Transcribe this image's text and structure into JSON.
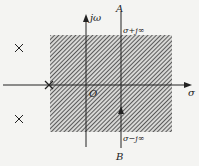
{
  "diagram": {
    "type": "s-plane inverse Laplace integration path",
    "axes": {
      "horizontal_label": "σ",
      "vertical_label": "jω",
      "origin_label": "O"
    },
    "integration_path": {
      "top_label": "A",
      "bottom_label": "B",
      "upper_limit": "σ+j∞",
      "lower_limit": "σ−j∞",
      "direction": "upward"
    },
    "region_of_convergence": {
      "style": "diagonal hatch",
      "color": "#555555"
    },
    "poles": [
      {
        "symbol": "×",
        "position": "left upper"
      },
      {
        "symbol": "×",
        "position": "left lower"
      },
      {
        "symbol": "×",
        "position": "on real axis at ROC left boundary"
      }
    ]
  }
}
